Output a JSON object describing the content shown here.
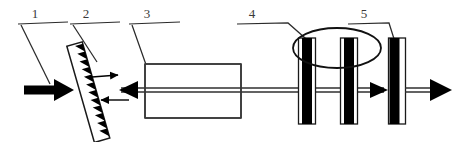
{
  "figure": {
    "title": "Schematic of external-cavity laser with grating, gain medium, modulator plates and output coupler",
    "width": 457,
    "height": 142,
    "background_color": "#ffffff",
    "line_color": "#000000",
    "label_color": "#3a3a3a"
  },
  "callouts": [
    {
      "id": "callout-1",
      "label": "1",
      "label_x": 35,
      "label_y": 18,
      "points_to": "input-beam-arrow",
      "leader_path": "M 18,24 L 68,22 M 22,24 L 51,83"
    },
    {
      "id": "callout-2",
      "label": "2",
      "label_x": 86,
      "label_y": 18,
      "points_to": "diffraction-grating",
      "leader_path": "M 69,24 L 119,22 M 72,24 L 95,60"
    },
    {
      "id": "callout-3",
      "label": "3",
      "label_x": 146,
      "label_y": 18,
      "points_to": "gain-medium-box",
      "leader_path": "M 129,24 L 179,22 M 132,24 L 156,93"
    },
    {
      "id": "callout-4",
      "label": "4",
      "label_x": 252,
      "label_y": 18,
      "points_to": "modulator-ellipse",
      "leader_path": "M 237,24 L 288,23 L 312,44"
    },
    {
      "id": "callout-5",
      "label": "5",
      "label_x": 364,
      "label_y": 18,
      "points_to": "output-coupler-plate",
      "leader_path": "M 348,24 L 389,23 L 394,41"
    }
  ],
  "components": {
    "input_beam": {
      "name": "input-beam-arrow",
      "description": "thick solid black arrow entering from left",
      "x_start": 24,
      "x_end": 72,
      "y": 90
    },
    "grating": {
      "name": "diffraction-grating",
      "description": "tilted blazed diffraction grating with sawtooth grooves",
      "tilt_degrees": -17,
      "tooth_count": 12
    },
    "diffracted_arrows": [
      {
        "name": "diffracted-order-arrow",
        "direction": "right",
        "x_start": 92,
        "x_end": 126,
        "y": 76
      },
      {
        "name": "feedback-order-arrow",
        "direction": "left",
        "x_start": 128,
        "x_end": 94,
        "y": 100
      }
    ],
    "gain_medium": {
      "name": "gain-medium-box",
      "description": "rectangular gain medium / laser cavity block",
      "x": 145,
      "y": 64,
      "width": 96,
      "height": 54
    },
    "optical_axis": {
      "name": "optical-axis",
      "description": "double horizontal beam line through the cavity",
      "y": 90,
      "x_start": 120,
      "x_end": 447,
      "left_arrow": true,
      "right_arrow": true
    },
    "modulator": {
      "name": "modulator-ellipse",
      "description": "ellipse encircling two vertical electro-optic plates",
      "cx": 337,
      "cy": 48,
      "rx": 44,
      "ry": 20,
      "plates": [
        {
          "name": "modulator-plate-left",
          "x": 300,
          "y": 38,
          "width": 16,
          "height": 86
        },
        {
          "name": "modulator-plate-right",
          "x": 342,
          "y": 38,
          "width": 16,
          "height": 86
        }
      ]
    },
    "output_coupler": {
      "name": "output-coupler-plate",
      "description": "output coupler mirror plate",
      "x": 389,
      "y": 38,
      "width": 16,
      "height": 86
    },
    "output_beam": {
      "name": "output-beam-arrow",
      "description": "thick solid black arrow exiting to the right",
      "x_start": 406,
      "x_end": 452,
      "y": 90
    }
  }
}
